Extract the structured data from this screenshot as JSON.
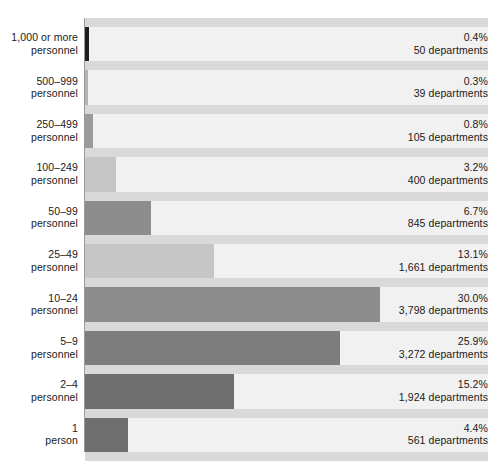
{
  "chart_data": {
    "type": "bar",
    "orientation": "horizontal",
    "title": "",
    "subtitle": "",
    "xlabel": "",
    "ylabel": "",
    "xlim": [
      0,
      40
    ],
    "grid": true,
    "gridlines_x": [
      5,
      10,
      15,
      20,
      25,
      30,
      35
    ],
    "legend": "none",
    "categories": [
      "1,000 or more personnel",
      "500–999 personnel",
      "250–499 personnel",
      "100–249 personnel",
      "50–99 personnel",
      "25–49 personnel",
      "10–24 personnel",
      "5–9 personnel",
      "2–4 personnel",
      "1 person"
    ],
    "values": [
      0.4,
      0.3,
      0.8,
      3.2,
      6.7,
      13.1,
      30.0,
      25.9,
      15.2,
      4.4
    ],
    "counts": [
      50,
      39,
      105,
      400,
      845,
      1661,
      3798,
      3272,
      1924,
      561
    ],
    "value_unit": "%",
    "count_unit": "departments"
  },
  "rows": [
    {
      "label_line1": "1,000 or more",
      "label_line2": "personnel",
      "pct": "0.4%",
      "count": "50 departments",
      "value": 0.4,
      "color": "#1f1f1f"
    },
    {
      "label_line1": "500–999",
      "label_line2": "personnel",
      "pct": "0.3%",
      "count": "39 departments",
      "value": 0.3,
      "color": "#b4b4b4"
    },
    {
      "label_line1": "250–499",
      "label_line2": "personnel",
      "pct": "0.8%",
      "count": "105 departments",
      "value": 0.8,
      "color": "#9b9b9b"
    },
    {
      "label_line1": "100–249",
      "label_line2": "personnel",
      "pct": "3.2%",
      "count": "400 departments",
      "value": 3.2,
      "color": "#c6c6c6"
    },
    {
      "label_line1": "50–99",
      "label_line2": "personnel",
      "pct": "6.7%",
      "count": "845 departments",
      "value": 6.7,
      "color": "#8d8d8d"
    },
    {
      "label_line1": "25–49",
      "label_line2": "personnel",
      "pct": "13.1%",
      "count": "1,661 departments",
      "value": 13.1,
      "color": "#c6c6c6"
    },
    {
      "label_line1": "10–24",
      "label_line2": "personnel",
      "pct": "30.0%",
      "count": "3,798 departments",
      "value": 30.0,
      "color": "#8d8d8d"
    },
    {
      "label_line1": "5–9",
      "label_line2": "personnel",
      "pct": "25.9%",
      "count": "3,272 departments",
      "value": 25.9,
      "color": "#7d7d7d"
    },
    {
      "label_line1": "2–4",
      "label_line2": "personnel",
      "pct": "15.2%",
      "count": "1,924 departments",
      "value": 15.2,
      "color": "#6e6e6e"
    },
    {
      "label_line1": "1",
      "label_line2": "person",
      "pct": "4.4%",
      "count": "561 departments",
      "value": 4.4,
      "color": "#6e6e6e"
    }
  ],
  "colors": {
    "plot_background": "#f1f1f1",
    "row_separator": "#d9d9d9",
    "gridline": "#ffffff",
    "axis": "#9a9a9a",
    "text": "#1a1a1a"
  }
}
